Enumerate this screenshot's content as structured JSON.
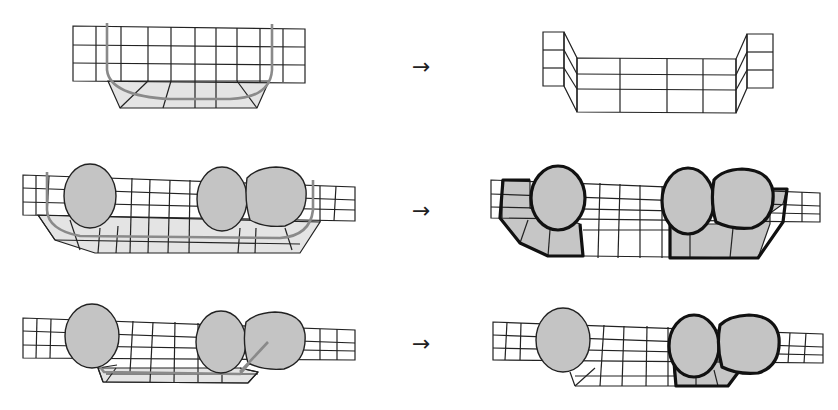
{
  "figure": {
    "rows": [
      {
        "id": "row-1",
        "arrow": "→",
        "input": "grid with U-shaped curve",
        "output": "bent U-shaped extracted strip"
      },
      {
        "id": "row-2",
        "arrow": "→",
        "input": "grid with three blobs and curve",
        "output": "two bold-outlined shaded regions around blobs"
      },
      {
        "id": "row-3",
        "arrow": "→",
        "input": "grid with three blobs and short curve",
        "output": "one bold-outlined shaded region around right blobs"
      }
    ],
    "colors": {
      "line": "#222222",
      "blob_fill": "#c4c4c4",
      "shaded_fill": "#c6c6c6",
      "light_fill": "#e4e4e4",
      "curve": "#8a8a8a",
      "bold_outline": "#111111"
    }
  }
}
